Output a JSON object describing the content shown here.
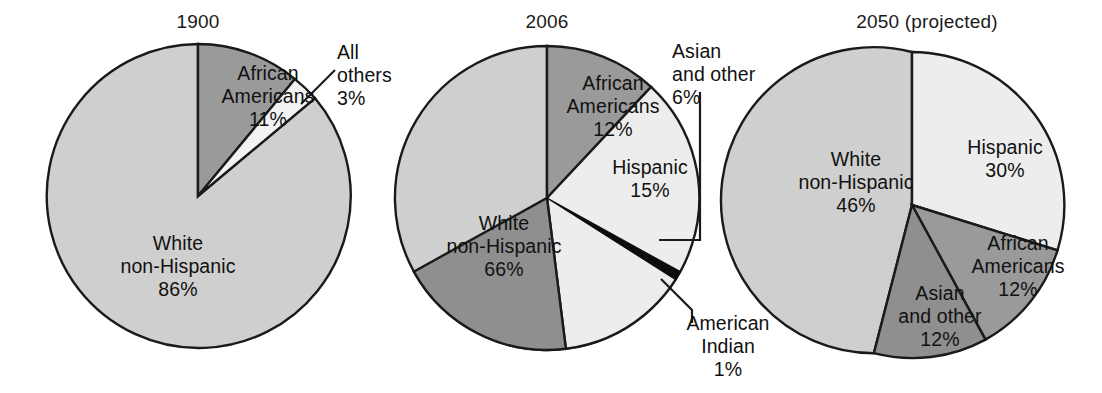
{
  "figure": {
    "background": "#ffffff",
    "text_color": "#111111"
  },
  "palette": {
    "white_non_hispanic": "#cfcfcf",
    "african_americans": "#9a9a9a",
    "hispanic": "#ededed",
    "all_others": "#f2f2f2",
    "asian_and_other": "#8f8f8f",
    "american_indian": "#0d0d0d",
    "outline": "#1a1a1a",
    "leader_line": "#1a1a1a"
  },
  "charts": [
    {
      "id": "1900",
      "title": "1900",
      "labels": {
        "african_americans": "African\nAmericans\n11%",
        "african_americans_name": "African\nAmericans",
        "african_americans_value": "11%",
        "white_non_hispanic_name": "White\nnon-Hispanic",
        "white_non_hispanic_value": "86%",
        "all_others_name": "All\nothers",
        "all_others_value": "3%"
      }
    },
    {
      "id": "2006",
      "title": "2006",
      "labels": {
        "african_americans_name": "African\nAmericans",
        "african_americans_value": "12%",
        "hispanic_name": "Hispanic",
        "hispanic_value": "15%",
        "white_non_hispanic_name": "White\nnon-Hispanic",
        "white_non_hispanic_value": "66%",
        "asian_and_other_name": "Asian\nand other",
        "asian_and_other_value": "6%",
        "american_indian_name": "American\nIndian",
        "american_indian_value": "1%"
      }
    },
    {
      "id": "2050",
      "title": "2050 (projected)",
      "labels": {
        "hispanic_name": "Hispanic",
        "hispanic_value": "30%",
        "white_non_hispanic_name": "White\nnon-Hispanic",
        "white_non_hispanic_value": "46%",
        "african_americans_name": "African\nAmericans",
        "african_americans_value": "12%",
        "asian_and_other_name": "Asian\nand other",
        "asian_and_other_value": "12%"
      }
    }
  ],
  "chart_data": [
    {
      "type": "pie",
      "title": "1900",
      "categories": [
        "African Americans",
        "All others",
        "White non-Hispanic"
      ],
      "values": [
        11,
        3,
        86
      ],
      "units": "percent",
      "start_angle_deg": 0,
      "direction": "clockwise",
      "colors": [
        "#9a9a9a",
        "#f2f2f2",
        "#cfcfcf"
      ],
      "labels": [
        "African Americans 11%",
        "All others 3%",
        "White non-Hispanic 86%"
      ],
      "callouts": [
        "All others"
      ],
      "legend": "none"
    },
    {
      "type": "pie",
      "title": "2006",
      "categories": [
        "African Americans",
        "Hispanic",
        "Asian and other",
        "American Indian",
        "White non-Hispanic"
      ],
      "values": [
        12,
        15,
        6,
        1,
        66
      ],
      "units": "percent",
      "start_angle_deg": 0,
      "direction": "clockwise",
      "colors": [
        "#9a9a9a",
        "#ededed",
        "#8f8f8f",
        "#0d0d0d",
        "#cfcfcf"
      ],
      "labels": [
        "African Americans 12%",
        "Hispanic 15%",
        "Asian and other 6%",
        "American Indian 1%",
        "White non-Hispanic 66%"
      ],
      "callouts": [
        "Asian and other",
        "American Indian"
      ],
      "legend": "none"
    },
    {
      "type": "pie",
      "title": "2050 (projected)",
      "categories": [
        "Hispanic",
        "African Americans",
        "Asian and other",
        "White non-Hispanic"
      ],
      "values": [
        30,
        12,
        12,
        46
      ],
      "units": "percent",
      "start_angle_deg": 0,
      "direction": "clockwise",
      "colors": [
        "#ededed",
        "#9a9a9a",
        "#8f8f8f",
        "#cfcfcf"
      ],
      "labels": [
        "Hispanic 30%",
        "African Americans 12%",
        "Asian and other 12%",
        "White non-Hispanic 46%"
      ],
      "callouts": [],
      "legend": "none"
    }
  ]
}
